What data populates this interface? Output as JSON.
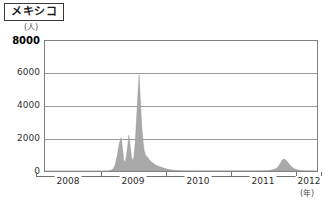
{
  "header": {
    "title": "メキシコ",
    "title_icon": "label-box"
  },
  "axes": {
    "y_unit": "(人)",
    "x_unit": "(年)",
    "y_ticks": [
      "8000",
      "6000",
      "4000",
      "2000",
      "0"
    ],
    "x_ticks": [
      "2008",
      "2009",
      "2010",
      "2011",
      "2012"
    ]
  },
  "colors": {
    "series_fill": "#a8a8a8",
    "series_stroke": "#8f8f8f",
    "grid": "#9a9a9a",
    "frame": "#808080",
    "axis": "#6f6f6f",
    "text": "#2b2b2b"
  },
  "chart_data": {
    "type": "area",
    "title": "メキシコ",
    "xlabel": "(年)",
    "ylabel": "(人)",
    "ylim": [
      0,
      8000
    ],
    "xlim": [
      2008.0,
      2012.25
    ],
    "grid": true,
    "legend": "none",
    "y_ticks": [
      0,
      2000,
      4000,
      6000,
      8000
    ],
    "x_ticks": [
      2008,
      2009,
      2010,
      2011,
      2012
    ],
    "series": [
      {
        "name": "メキシコ 患者数",
        "x": [
          2008.0,
          2008.08,
          2008.17,
          2008.25,
          2008.33,
          2008.42,
          2008.5,
          2008.58,
          2008.67,
          2008.75,
          2008.83,
          2008.9,
          2008.96,
          2009.0,
          2009.04,
          2009.07,
          2009.1,
          2009.13,
          2009.16,
          2009.19,
          2009.21,
          2009.23,
          2009.25,
          2009.27,
          2009.29,
          2009.31,
          2009.33,
          2009.35,
          2009.37,
          2009.39,
          2009.41,
          2009.43,
          2009.45,
          2009.47,
          2009.49,
          2009.51,
          2009.53,
          2009.55,
          2009.57,
          2009.59,
          2009.61,
          2009.63,
          2009.65,
          2009.67,
          2009.69,
          2009.71,
          2009.74,
          2009.77,
          2009.8,
          2009.84,
          2009.88,
          2009.92,
          2009.96,
          2010.0,
          2010.08,
          2010.17,
          2010.25,
          2010.33,
          2010.42,
          2010.5,
          2010.58,
          2010.67,
          2010.75,
          2010.83,
          2010.92,
          2011.0,
          2011.08,
          2011.17,
          2011.25,
          2011.33,
          2011.42,
          2011.5,
          2011.58,
          2011.63,
          2011.67,
          2011.7,
          2011.73,
          2011.76,
          2011.79,
          2011.82,
          2011.85,
          2011.88,
          2011.92,
          2011.96,
          2012.0,
          2012.08,
          2012.17,
          2012.25
        ],
        "values": [
          0,
          0,
          0,
          0,
          0,
          0,
          0,
          0,
          0,
          0,
          0,
          0,
          0,
          20,
          60,
          150,
          420,
          980,
          1700,
          2050,
          1450,
          700,
          520,
          860,
          1500,
          2200,
          1600,
          900,
          620,
          900,
          1750,
          3200,
          4600,
          5900,
          4400,
          2900,
          1900,
          1250,
          980,
          900,
          820,
          700,
          600,
          540,
          470,
          420,
          360,
          300,
          250,
          200,
          150,
          110,
          70,
          45,
          30,
          20,
          15,
          12,
          10,
          8,
          8,
          8,
          8,
          8,
          8,
          8,
          8,
          8,
          8,
          10,
          15,
          30,
          90,
          200,
          420,
          640,
          740,
          700,
          560,
          400,
          270,
          170,
          100,
          55,
          30,
          15,
          8,
          5
        ]
      }
    ]
  }
}
